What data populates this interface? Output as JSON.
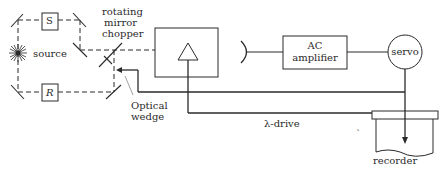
{
  "diagram": {
    "type": "block-diagram",
    "colors": {
      "line": "#2a2a2a",
      "background": "#ffffff"
    },
    "labels": {
      "sample": "S",
      "reference": "R",
      "source": "source",
      "chopper_line1": "rotating",
      "chopper_line2": "mirror",
      "chopper_line3": "chopper",
      "wedge_line1": "Optical",
      "wedge_line2": "wedge",
      "amp_line1": "AC",
      "amp_line2": "amplifier",
      "servo": "servo",
      "lambda_drive": "λ-drive",
      "recorder": "recorder",
      "stray_mark": "ˋ"
    },
    "nodes": [
      {
        "id": "source",
        "label": "source"
      },
      {
        "id": "sample-cell",
        "label": "S"
      },
      {
        "id": "reference-cell",
        "label": "R"
      },
      {
        "id": "rotating-mirror-chopper",
        "label": "rotating mirror chopper"
      },
      {
        "id": "optical-wedge",
        "label": "Optical wedge"
      },
      {
        "id": "monochromator",
        "label": ""
      },
      {
        "id": "detector",
        "label": ""
      },
      {
        "id": "ac-amplifier",
        "label": "AC amplifier"
      },
      {
        "id": "servo",
        "label": "servo"
      },
      {
        "id": "recorder",
        "label": "recorder"
      }
    ],
    "edges": [
      {
        "from": "source",
        "to": "sample-cell",
        "style": "dashed"
      },
      {
        "from": "source",
        "to": "reference-cell",
        "style": "dashed"
      },
      {
        "from": "sample-cell",
        "to": "rotating-mirror-chopper",
        "style": "dashed"
      },
      {
        "from": "reference-cell",
        "to": "rotating-mirror-chopper",
        "style": "dashed"
      },
      {
        "from": "rotating-mirror-chopper",
        "to": "monochromator",
        "style": "dashed"
      },
      {
        "from": "detector",
        "to": "ac-amplifier",
        "style": "solid"
      },
      {
        "from": "ac-amplifier",
        "to": "servo",
        "style": "solid"
      },
      {
        "from": "servo",
        "to": "optical-wedge",
        "style": "solid-arrow"
      },
      {
        "from": "servo",
        "to": "recorder",
        "style": "solid-arrow"
      },
      {
        "from": "recorder",
        "to": "monochromator",
        "style": "solid-arrow",
        "label": "λ-drive"
      }
    ]
  }
}
